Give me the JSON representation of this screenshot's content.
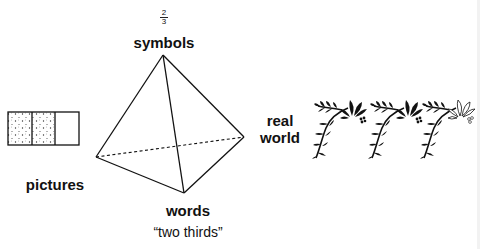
{
  "diagram": {
    "nodes": {
      "symbols": {
        "label": "symbols",
        "fraction": {
          "numerator": "2",
          "denominator": "3"
        }
      },
      "pictures": {
        "label": "pictures",
        "model": {
          "parts": 3,
          "shaded": 2
        }
      },
      "real_world": {
        "label_line1": "real",
        "label_line2": "world",
        "sprigs": {
          "count": 3,
          "filled_flowers": 2
        }
      },
      "words": {
        "label": "words",
        "phrase": "“two thirds”"
      }
    },
    "shape": "tetrahedron",
    "hidden_edge_style": "dashed"
  }
}
